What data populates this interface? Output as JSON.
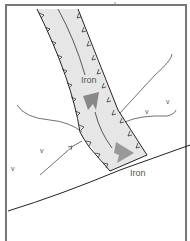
{
  "diagram": {
    "type": "schematic illustration",
    "labels": {
      "upper_iron": "Iron",
      "lower_iron": "Iron"
    },
    "markers": [
      {
        "glyph": "v",
        "x": 151,
        "y": 113
      },
      {
        "glyph": "v",
        "x": 170,
        "y": 103
      },
      {
        "glyph": "v",
        "x": 40,
        "y": 152
      },
      {
        "glyph": "v",
        "x": 12,
        "y": 162
      }
    ],
    "colors": {
      "frame": "#777777",
      "vessel_fill": "#e6e6e6",
      "vessel_outline": "#222222",
      "arrow": "#888888",
      "line": "#333333",
      "text": "#555555",
      "background": "#ffffff"
    }
  }
}
